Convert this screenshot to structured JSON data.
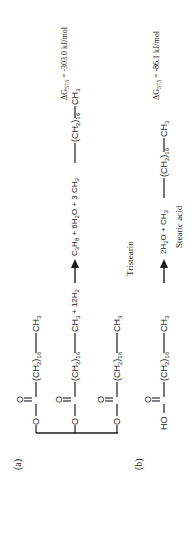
{
  "figure": {
    "part_a": {
      "label": "(a)",
      "chain_group": "(CH",
      "chain_sub2": "2",
      "chain_close": ")",
      "chain_count": "16",
      "terminal_group": "CH",
      "terminal_sub": "3",
      "reactant_h2": "+ 12H",
      "reactant_h2_sub": "2",
      "product_propane": "C",
      "product_propane_sub1": "3",
      "product_propane_h": "H",
      "product_propane_sub2": "8",
      "product_water": " + 6H",
      "product_water_sub": "2",
      "product_water_o": "O + 3 CH",
      "product_ch3_sub": "3",
      "product_chain_count": "16",
      "name": "Tristearin",
      "delta_g_symbol": "ΔG",
      "delta_g_temp": "573",
      "delta_g_value": " = -303.0 kJ/mol"
    },
    "part_b": {
      "label": "(b)",
      "acid_head": "HO",
      "chain_group": "(CH",
      "chain_sub2": "2",
      "chain_close": ")",
      "chain_count": "16",
      "terminal_group": "CH",
      "terminal_sub": "3",
      "product_water": "2H",
      "product_water_sub": "2",
      "product_plus": "O + CH",
      "product_ch3_sub": "3",
      "product_chain_count": "16",
      "name": "Stearic acid",
      "delta_g_symbol": "ΔG",
      "delta_g_temp": "573",
      "delta_g_value": " = -86.1 kJ/mol"
    },
    "atoms": {
      "oxygen": "O"
    }
  }
}
